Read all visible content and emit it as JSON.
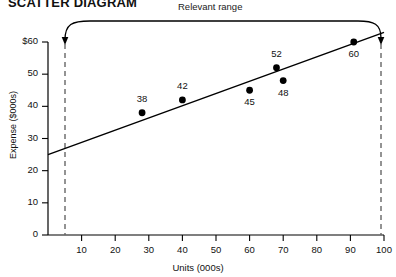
{
  "title": "SCATTER DIAGRAM",
  "annotation": {
    "relevant_range_label": "Relevant range"
  },
  "axis": {
    "y_title": "Expense ($000s)",
    "x_title": "Units (000s)"
  },
  "chart_data": {
    "type": "scatter",
    "title": "SCATTER DIAGRAM",
    "xlabel": "Units (000s)",
    "ylabel": "Expense ($000s)",
    "xlim": [
      0,
      100
    ],
    "ylim": [
      0,
      60
    ],
    "grid": false,
    "legend": null,
    "x_ticks": [
      10,
      20,
      30,
      40,
      50,
      60,
      70,
      80,
      90,
      100
    ],
    "x_tick_labels": [
      "10",
      "20",
      "30",
      "40",
      "50",
      "60",
      "70",
      "80",
      "90",
      "100"
    ],
    "y_ticks": [
      0,
      10,
      20,
      30,
      40,
      50,
      60
    ],
    "y_tick_labels": [
      "0",
      "10",
      "20",
      "30",
      "40",
      "50",
      "$60"
    ],
    "points": [
      {
        "label": "38",
        "x": 28,
        "y": 38,
        "label_pos": "above"
      },
      {
        "label": "42",
        "x": 40,
        "y": 42,
        "label_pos": "above"
      },
      {
        "label": "45",
        "x": 60,
        "y": 45,
        "label_pos": "below"
      },
      {
        "label": "48",
        "x": 70,
        "y": 48,
        "label_pos": "below"
      },
      {
        "label": "52",
        "x": 68,
        "y": 52,
        "label_pos": "above"
      },
      {
        "label": "60",
        "x": 91,
        "y": 60,
        "label_pos": "below"
      }
    ],
    "trend_line": {
      "x0": 0,
      "y0": 25,
      "x1": 100,
      "y1": 63
    },
    "relevant_range": {
      "x_start": 5,
      "x_end": 100,
      "label": "Relevant range"
    }
  }
}
